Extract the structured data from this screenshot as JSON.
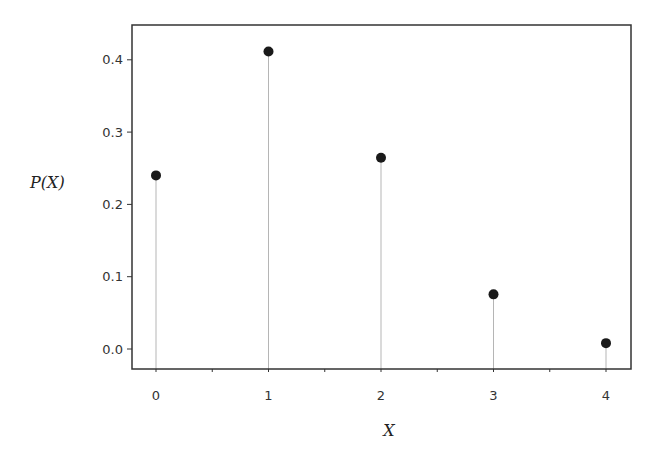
{
  "chart_data": {
    "type": "stem",
    "title": "",
    "xlabel": "X",
    "ylabel": "P(X)",
    "x": [
      0,
      1,
      2,
      3,
      4
    ],
    "values": [
      0.2401,
      0.4116,
      0.2646,
      0.0756,
      0.0081
    ],
    "x_ticks": [
      "0",
      "1",
      "2",
      "3",
      "4"
    ],
    "y_ticks": [
      "0.0",
      "0.1",
      "0.2",
      "0.3",
      "0.4"
    ],
    "xlim": [
      -0.25,
      4.2
    ],
    "ylim": [
      -0.03,
      0.445
    ],
    "grid": false,
    "legend": null,
    "colors": {
      "marker": "#1a1a1a",
      "stem": "#b5b5b5",
      "frame": "#333333"
    }
  },
  "labels": {
    "xlabel": "X",
    "ylabel": "P(X)"
  }
}
